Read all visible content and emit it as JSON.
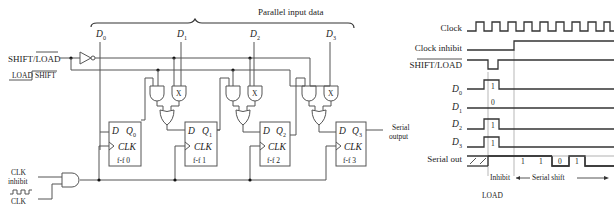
{
  "circuit": {
    "title": "Parallel input data",
    "data_inputs": [
      {
        "label": "D",
        "sub": "0"
      },
      {
        "label": "D",
        "sub": "1"
      },
      {
        "label": "D",
        "sub": "2"
      },
      {
        "label": "D",
        "sub": "3"
      }
    ],
    "control": {
      "shift_load_label": "SHIFT/LOAD",
      "mode_low": "LOAD",
      "mode_high": "SHIFT"
    },
    "clock": {
      "inhibit_line1": "CLK",
      "inhibit_line2": "inhibit",
      "clk_label": "CLK"
    },
    "flip_flops": [
      {
        "d": "D",
        "q": "Q",
        "q_sub": "0",
        "clk": "CLK",
        "name": "f-f  0"
      },
      {
        "d": "D",
        "q": "Q",
        "q_sub": "1",
        "clk": "CLK",
        "name": "f-f  1"
      },
      {
        "d": "D",
        "q": "Q",
        "q_sub": "2",
        "clk": "CLK",
        "name": "f-f  2"
      },
      {
        "d": "D",
        "q": "Q",
        "q_sub": "3",
        "clk": "CLK",
        "name": "f-f  3"
      }
    ],
    "gate_mark": "X",
    "output_line1": "Serial",
    "output_line2": "output"
  },
  "timing": {
    "signals": [
      {
        "label": "Clock"
      },
      {
        "label": "Clock inhibit"
      },
      {
        "label": "SHIFT/LOAD"
      },
      {
        "label": "D",
        "sub": "0",
        "value": "1"
      },
      {
        "label": "D",
        "sub": "1",
        "value": "0"
      },
      {
        "label": "D",
        "sub": "2",
        "value": "1"
      },
      {
        "label": "D",
        "sub": "3",
        "value": "1"
      },
      {
        "label": "Serial out"
      }
    ],
    "serial_bits": [
      "1",
      "1",
      "0",
      "1"
    ],
    "inhibit_label": "Inhibit",
    "shift_label": "Serial shift",
    "load_label": "LOAD"
  }
}
